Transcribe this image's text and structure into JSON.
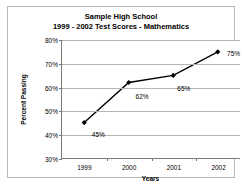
{
  "chart_data": {
    "type": "line",
    "title": "Sample High School",
    "subtitle": "1999 - 2002 Test Scores - Mathematics",
    "xlabel": "Years",
    "ylabel": "Percent Passing",
    "categories": [
      "1999",
      "2000",
      "2001",
      "2002"
    ],
    "values": [
      45,
      62,
      65,
      75
    ],
    "point_labels": [
      "45%",
      "62%",
      "65%",
      "75%"
    ],
    "ylim": [
      30,
      80
    ],
    "ytick_labels": [
      "30%",
      "40%",
      "50%",
      "60%",
      "70%",
      "80%"
    ],
    "ytick_values": [
      30,
      40,
      50,
      60,
      70,
      80
    ],
    "grid": "horizontal",
    "legend": "none",
    "series_color": "#000000",
    "marker": "diamond",
    "gridline_color": "#b4b4b4",
    "axis_color": "#7a7a7a",
    "background_color": "#ffffff",
    "border_color": "#b8b8b8"
  }
}
